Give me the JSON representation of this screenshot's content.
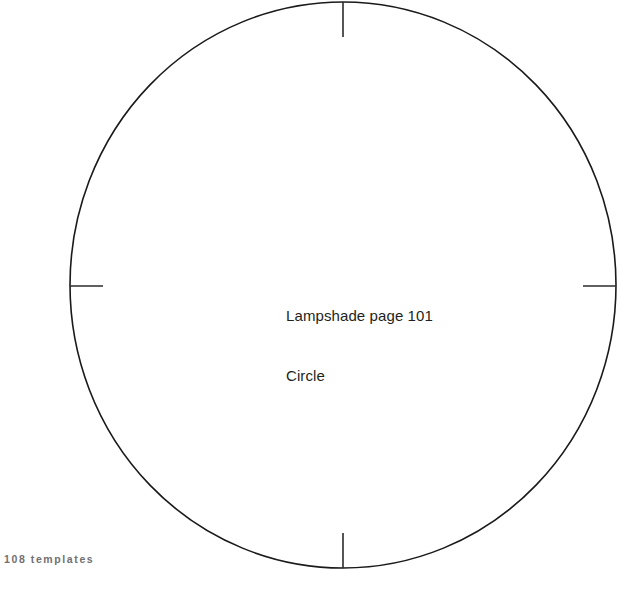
{
  "page": {
    "background_color": "#ffffff",
    "width": 623,
    "height": 593
  },
  "template": {
    "shape_name": "circle-outline",
    "stroke_color": "#1a1a1a",
    "stroke_width": 1.6,
    "fill": "none",
    "center_x": 343,
    "center_y": 285,
    "radius_x": 273,
    "radius_y": 283,
    "registration_marks": {
      "stroke_color": "#2b2b2b",
      "stroke_width": 1.6,
      "length": 35,
      "positions": [
        "top",
        "right",
        "bottom",
        "left"
      ]
    }
  },
  "label": {
    "line1": "Lampshade page 101",
    "line2": "Circle",
    "color": "#231f20"
  },
  "footer": {
    "text": "108 templates",
    "page_number": "108",
    "section": "templates",
    "color": "#6f7072"
  }
}
